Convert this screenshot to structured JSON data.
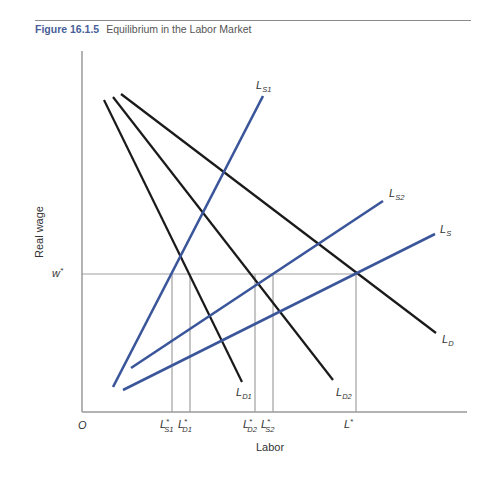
{
  "figure": {
    "number": "Figure 16.1.5",
    "title": "Equilibrium in the Labor Market"
  },
  "chart_data": {
    "type": "line",
    "title": "Equilibrium in the Labor Market",
    "xlabel": "Labor",
    "ylabel": "Real wage",
    "origin_label": "O",
    "grid": false,
    "colors": {
      "demand": "#1a1a1a",
      "supply": "#3a559a",
      "axis": "#9a9a9a",
      "guide": "#a0a0a0"
    },
    "equilibrium_wage_label": "w*",
    "series": [
      {
        "name": "L_D1",
        "label_main": "L",
        "label_sub": "D1",
        "kind": "demand",
        "x1": 104,
        "y1": 100,
        "x2": 242,
        "y2": 382,
        "lx": 236,
        "ly": 396
      },
      {
        "name": "L_D2",
        "label_main": "L",
        "label_sub": "D2",
        "kind": "demand",
        "x1": 113,
        "y1": 97,
        "x2": 333,
        "y2": 380,
        "lx": 336,
        "ly": 396
      },
      {
        "name": "L_D",
        "label_main": "L",
        "label_sub": "D",
        "kind": "demand",
        "x1": 121,
        "y1": 94,
        "x2": 436,
        "y2": 333,
        "lx": 442,
        "ly": 343
      },
      {
        "name": "L_S1",
        "label_main": "L",
        "label_sub": "S1",
        "kind": "supply",
        "x1": 113,
        "y1": 387,
        "x2": 263,
        "y2": 96,
        "lx": 256,
        "ly": 89
      },
      {
        "name": "L_S2",
        "label_main": "L",
        "label_sub": "S2",
        "kind": "supply",
        "x1": 131,
        "y1": 368,
        "x2": 383,
        "y2": 201,
        "lx": 389,
        "ly": 197
      },
      {
        "name": "L_S",
        "label_main": "L",
        "label_sub": "S",
        "kind": "supply",
        "x1": 123,
        "y1": 390,
        "x2": 435,
        "y2": 234,
        "lx": 440,
        "ly": 233
      }
    ],
    "x_ticks": [
      {
        "label_main": "L*",
        "label_sub": "S1",
        "x": 172
      },
      {
        "label_main": "L*",
        "label_sub": "D1",
        "x": 190
      },
      {
        "label_main": "L*",
        "label_sub": "D2",
        "x": 255
      },
      {
        "label_main": "L*",
        "label_sub": "S2",
        "x": 273
      },
      {
        "label_main": "L*",
        "label_sub": "",
        "x": 356
      }
    ],
    "w_star_y": 274,
    "axes": {
      "x0": 82,
      "y_top": 51,
      "y_axis_bottom": 412,
      "x_right": 467
    }
  }
}
